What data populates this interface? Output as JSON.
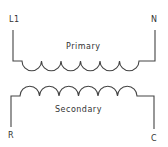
{
  "diagram": {
    "type": "transformer-schematic",
    "stroke_color": "#444444",
    "primary": {
      "label": "Primary",
      "terminals": {
        "left": "L1",
        "right": "N"
      },
      "coil_turns": 6
    },
    "secondary": {
      "label": "Secondary",
      "terminals": {
        "left": "R",
        "right": "C"
      },
      "coil_turns": 6
    }
  }
}
